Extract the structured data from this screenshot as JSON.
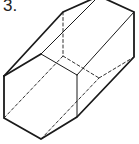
{
  "figure": {
    "label": "3.",
    "colors": {
      "stroke": "#1a1a1a",
      "background": "#ffffff"
    },
    "front_face": [
      [
        4,
        76
      ],
      [
        41,
        54
      ],
      [
        77,
        75
      ],
      [
        77,
        117
      ],
      [
        41,
        139
      ],
      [
        4,
        118
      ]
    ],
    "back_face": [
      [
        63,
        12
      ],
      [
        99,
        -4
      ],
      [
        134,
        12
      ],
      [
        134,
        57
      ],
      [
        99,
        78
      ],
      [
        63,
        56
      ]
    ],
    "visible_lateral_edges": [
      [
        [
          4,
          76
        ],
        [
          63,
          12
        ]
      ],
      [
        [
          41,
          54
        ],
        [
          99,
          -4
        ]
      ],
      [
        [
          77,
          75
        ],
        [
          134,
          12
        ]
      ],
      [
        [
          77,
          117
        ],
        [
          134,
          57
        ]
      ]
    ],
    "hidden_edges": [
      [
        [
          41,
          139
        ],
        [
          99,
          78
        ]
      ],
      [
        [
          4,
          118
        ],
        [
          63,
          56
        ]
      ]
    ]
  }
}
